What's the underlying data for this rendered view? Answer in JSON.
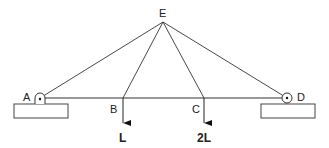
{
  "diagram": {
    "type": "truss",
    "nodes": {
      "A": {
        "label": "A",
        "x": 40,
        "y": 98,
        "support": "pin"
      },
      "B": {
        "label": "B",
        "x": 123,
        "y": 98
      },
      "C": {
        "label": "C",
        "x": 204,
        "y": 98
      },
      "D": {
        "label": "D",
        "x": 287,
        "y": 98,
        "support": "roller"
      },
      "E": {
        "label": "E",
        "x": 163,
        "y": 22
      }
    },
    "members": [
      [
        "A",
        "D"
      ],
      [
        "A",
        "E"
      ],
      [
        "B",
        "E"
      ],
      [
        "C",
        "E"
      ],
      [
        "D",
        "E"
      ]
    ],
    "loads": [
      {
        "node": "B",
        "label": "L",
        "direction": "down"
      },
      {
        "node": "C",
        "label": "2L",
        "direction": "down"
      }
    ],
    "line_color": "#333333"
  }
}
